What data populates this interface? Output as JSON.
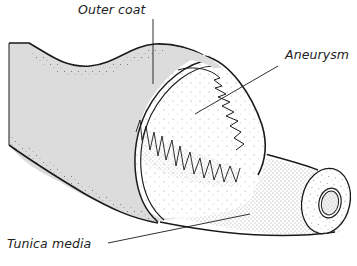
{
  "diagram": {
    "type": "anatomical-illustration",
    "labels": {
      "outer_coat": "Outer coat",
      "aneurysm": "Aneurysm",
      "tunica_media": "Tunica media"
    },
    "colors": {
      "outer_coat_fill": "#dcdcdc",
      "inner_fill": "#ffffff",
      "stroke": "#1a1a1a",
      "stipple": "#333333",
      "text": "#222222"
    }
  }
}
